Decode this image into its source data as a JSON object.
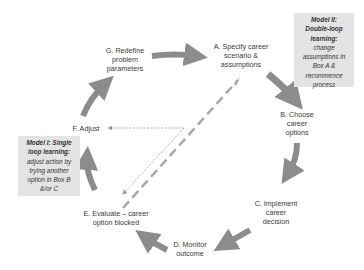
{
  "diagram": {
    "nodes": [
      {
        "id": "A",
        "lines": [
          "A. Specify career",
          "scenario &",
          "assumptions"
        ]
      },
      {
        "id": "B",
        "lines": [
          "B. Choose",
          "career",
          "options"
        ]
      },
      {
        "id": "C",
        "lines": [
          "C. Implement",
          "career",
          "decision"
        ]
      },
      {
        "id": "D",
        "lines": [
          "D. Monitor",
          "outcome"
        ]
      },
      {
        "id": "E",
        "lines": [
          "E. Evaluate – career",
          "option blocked"
        ]
      },
      {
        "id": "F",
        "lines": [
          "F. Adjust"
        ]
      },
      {
        "id": "G",
        "lines": [
          "G. Redefine",
          "problem",
          "parameters"
        ]
      }
    ],
    "model2": {
      "title_lines": [
        "Model II:",
        "Double-loop",
        "learning:"
      ],
      "body_lines": [
        "change",
        "assumptions in",
        "Box A &",
        "recommence",
        "process"
      ]
    },
    "model1": {
      "title_lines": [
        "Model I: Single",
        "loop learning:"
      ],
      "body_lines": [
        "adjust action by",
        "trying another",
        "option in Box B",
        "&/or C"
      ]
    },
    "colors": {
      "arrow": "#8c8c8c",
      "box_bg": "#e4e4e4",
      "dashed_long": "#a8a8a8",
      "dashed_short": "#9a9a9a"
    }
  }
}
